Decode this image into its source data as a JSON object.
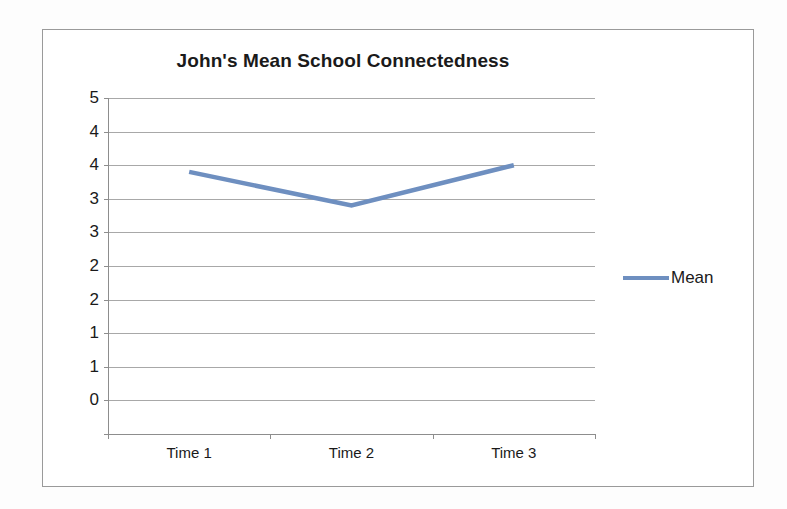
{
  "chart_data": {
    "type": "line",
    "title": "John's Mean School Connectedness",
    "xlabel": "",
    "ylabel": "",
    "categories": [
      "Time 1",
      "Time 2",
      "Time 3"
    ],
    "series": [
      {
        "name": "Mean",
        "values": [
          3.9,
          3.4,
          4.0
        ],
        "color": "#6E8FC0"
      }
    ],
    "ylim": [
      0,
      5
    ],
    "y_tick_values": [
      5,
      4.5,
      4,
      3.5,
      3,
      2.5,
      2,
      1.5,
      1,
      0.5,
      0
    ],
    "y_tick_labels": [
      "5",
      "4",
      "4",
      "3",
      "3",
      "2",
      "2",
      "1",
      "1",
      "0"
    ],
    "grid": true,
    "legend_position": "right",
    "legend_entries": [
      "Mean"
    ]
  },
  "legend": {
    "series_label": "Mean"
  },
  "axis": {
    "x_labels": [
      "Time 1",
      "Time 2",
      "Time 3"
    ]
  },
  "colors": {
    "series_line": "#6E8FC0",
    "gridline": "#A8A8A8",
    "axis": "#8D8D8D",
    "frame": "#9A9A9A",
    "text": "#1A1A1A",
    "background": "#FFFFFF"
  }
}
